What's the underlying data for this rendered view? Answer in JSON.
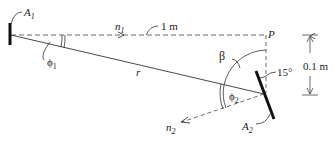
{
  "diagram": {
    "labels": {
      "A1": "A",
      "A1_sub": "1",
      "A2": "A",
      "A2_sub": "2",
      "n1": "n",
      "n1_sub": "1",
      "n2": "n",
      "n2_sub": "2",
      "phi1": "ϕ",
      "phi1_sub": "1",
      "phi2": "ϕ",
      "phi2_sub": "2",
      "r": "r",
      "beta": "β",
      "P": "P",
      "distance_horizontal": "1 m",
      "distance_vertical": "0.1 m",
      "angle_tilt": "15°"
    },
    "colors": {
      "line": "#333333",
      "surface": "#111111"
    }
  }
}
